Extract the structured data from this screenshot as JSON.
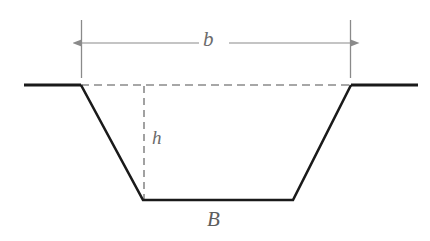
{
  "figure": {
    "kind": "engineering-cross-section-diagram",
    "background_color": "#ffffff",
    "width": 430,
    "height": 241
  },
  "labels": {
    "top_width": "b",
    "depth": "h",
    "bottom_width": "B"
  },
  "colors": {
    "channel_outline": "#1a1a1a",
    "ground_line": "#1a1a1a",
    "dashed_guide": "#8a8a8a",
    "dimension_line": "#8a8a8a",
    "extension_line": "#8a8a8a",
    "label_text": "#6b6b6b"
  },
  "geometry": {
    "ground_level_y": 85,
    "bottom_level_y": 200,
    "left_ground_start_x": 24,
    "left_top_corner_x": 81,
    "right_top_corner_x": 351,
    "right_ground_end_x": 418,
    "bottom_left_corner_x": 143,
    "bottom_right_corner_x": 293,
    "depth_guide_x": 144,
    "dimension_line_y": 43,
    "extension_line_top_y": 20,
    "extension_line_bottom_y": 78,
    "outline_stroke_width": 2.6,
    "thin_stroke_width": 1.1
  },
  "annotations": {
    "top_width_dimension": {
      "label": "b",
      "from_x": 81,
      "to_x": 351,
      "y": 43,
      "arrowheads": "both"
    },
    "depth_guide": {
      "label": "h",
      "x": 144,
      "from_y": 86,
      "to_y": 200,
      "style": "dashed"
    },
    "water_surface_guide": {
      "from_x": 81,
      "to_x": 351,
      "y": 85,
      "style": "dashed"
    },
    "bottom_width_label": {
      "label": "B",
      "x": 215,
      "y": 222
    }
  }
}
